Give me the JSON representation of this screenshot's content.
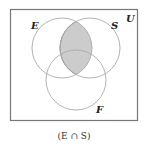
{
  "diagram": {
    "type": "venn",
    "universe_label": "U",
    "sets": [
      {
        "label": "E",
        "cx": 62,
        "cy": 48,
        "r": 30
      },
      {
        "label": "S",
        "cx": 90,
        "cy": 48,
        "r": 30
      },
      {
        "label": "F",
        "cx": 76,
        "cy": 80,
        "r": 30
      }
    ],
    "shaded_region": "E ∩ S",
    "caption": "(E ∩ S)",
    "colors": {
      "border": "#777777",
      "circle_stroke": "#aaaaaa",
      "shade": "#cccccc",
      "shade_stroke": "#888888"
    }
  }
}
